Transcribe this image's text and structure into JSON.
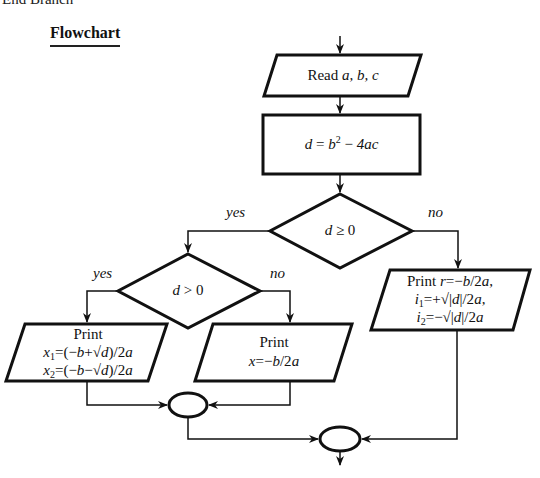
{
  "page": {
    "cut_off_text": "End Branch",
    "heading": "Flowchart"
  },
  "flowchart": {
    "title": "Flowchart",
    "nodes": [
      {
        "id": "input",
        "type": "parallelogram",
        "text": "Read a, b, c"
      },
      {
        "id": "compute",
        "type": "process",
        "text": "d = b² − 4ac"
      },
      {
        "id": "decision1",
        "type": "decision",
        "text": "d ≥ 0"
      },
      {
        "id": "decision2",
        "type": "decision",
        "text": "d > 0"
      },
      {
        "id": "out_two_real",
        "type": "parallelogram",
        "lines": [
          "Print",
          "x₁=(−b+√d)/2a",
          "x₂=(−b−√d)/2a"
        ]
      },
      {
        "id": "out_one_real",
        "type": "parallelogram",
        "lines": [
          "Print",
          "x=−b/2a"
        ]
      },
      {
        "id": "out_complex",
        "type": "parallelogram",
        "lines": [
          "Print r=−b/2a,",
          "i₁=+√|d|/2a,",
          "i₂=−√|d|/2a"
        ]
      },
      {
        "id": "join1",
        "type": "connector",
        "text": ""
      },
      {
        "id": "join2",
        "type": "connector",
        "text": ""
      }
    ],
    "edges": [
      {
        "from": "start",
        "to": "input",
        "label": ""
      },
      {
        "from": "input",
        "to": "compute",
        "label": ""
      },
      {
        "from": "compute",
        "to": "decision1",
        "label": ""
      },
      {
        "from": "decision1",
        "to": "decision2",
        "label": "yes"
      },
      {
        "from": "decision1",
        "to": "out_complex",
        "label": "no"
      },
      {
        "from": "decision2",
        "to": "out_two_real",
        "label": "yes"
      },
      {
        "from": "decision2",
        "to": "out_one_real",
        "label": "no"
      },
      {
        "from": "out_two_real",
        "to": "join1",
        "label": ""
      },
      {
        "from": "out_one_real",
        "to": "join1",
        "label": ""
      },
      {
        "from": "join1",
        "to": "join2",
        "label": ""
      },
      {
        "from": "out_complex",
        "to": "join2",
        "label": ""
      },
      {
        "from": "join2",
        "to": "end",
        "label": ""
      }
    ],
    "labels": {
      "read_prefix": "Read ",
      "read_vars": "a, b, c",
      "d_var": "d",
      "eq": " = ",
      "b_var": "b",
      "sq": "2",
      "minus_4ac_op": " − ",
      "four_ac": "4ac",
      "dec1_d": "d",
      "dec1_op": " ≥ 0",
      "dec2_d": "d",
      "dec2_op": " > 0",
      "yes1": "yes",
      "no1": "no",
      "yes2": "yes",
      "no2": "no",
      "print": "Print",
      "x": "x",
      "sub1": "1",
      "sub2": "2",
      "x1_expr_a": "=(−",
      "b": "b",
      "x1_expr_b": "+√",
      "x2_expr_b": "−√",
      "d": "d",
      "expr_end": ")/2",
      "a": "a",
      "x_mid_eq": "=−",
      "slash2": "/2",
      "print_r": "Print ",
      "r": "r",
      "i": "i",
      "i1_rest": "=+√|",
      "i2_rest": "=−√|",
      "abs_end": "|/2",
      "comma": ","
    }
  }
}
